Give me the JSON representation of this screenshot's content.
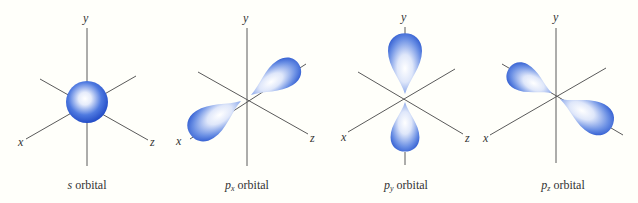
{
  "figure": {
    "colors": {
      "background": "#fffffa",
      "axis": "#5a5a5a",
      "lobe_dark": "#2f5fd6",
      "lobe_light": "#ffffff",
      "label": "#333333"
    },
    "panels": [
      {
        "id": "s",
        "caption_prefix": "s",
        "caption_sub": "",
        "caption_suffix": " orbital",
        "axis_labels": {
          "x": "x",
          "y": "y",
          "z": "z"
        }
      },
      {
        "id": "px",
        "caption_prefix": "p",
        "caption_sub": "x",
        "caption_suffix": " orbital",
        "axis_labels": {
          "x": "x",
          "y": "y",
          "z": "z"
        }
      },
      {
        "id": "py",
        "caption_prefix": "p",
        "caption_sub": "y",
        "caption_suffix": " orbital",
        "axis_labels": {
          "x": "x",
          "y": "y",
          "z": "z"
        }
      },
      {
        "id": "pz",
        "caption_prefix": "p",
        "caption_sub": "z",
        "caption_suffix": " orbital",
        "axis_labels": {
          "x": "x",
          "y": "y",
          "z": "z"
        }
      }
    ]
  }
}
